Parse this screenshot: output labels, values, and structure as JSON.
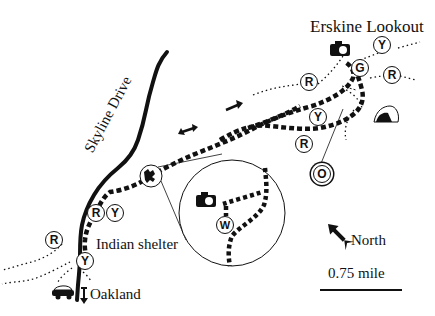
{
  "map": {
    "labels": {
      "lookout": "Erskine Lookout",
      "road": "Skyline Drive",
      "shelter": "Indian shelter",
      "town": "Oakland",
      "north": "North",
      "scale": "0.75 mile"
    },
    "markers": [
      {
        "id": "R1",
        "letter": "R",
        "x": 309,
        "y": 82
      },
      {
        "id": "Y1",
        "letter": "Y",
        "x": 318,
        "y": 117
      },
      {
        "id": "G1",
        "letter": "G",
        "x": 360,
        "y": 68
      },
      {
        "id": "Y2",
        "letter": "Y",
        "x": 382,
        "y": 45
      },
      {
        "id": "R2",
        "letter": "R",
        "x": 392,
        "y": 75
      },
      {
        "id": "R3",
        "letter": "R",
        "x": 304,
        "y": 144
      },
      {
        "id": "O1",
        "letter": "O",
        "x": 322,
        "y": 174
      },
      {
        "id": "R4",
        "letter": "R",
        "x": 96,
        "y": 213
      },
      {
        "id": "Y3",
        "letter": "Y",
        "x": 115,
        "y": 213
      },
      {
        "id": "R5",
        "letter": "R",
        "x": 54,
        "y": 240
      },
      {
        "id": "Y4",
        "letter": "Y",
        "x": 85,
        "y": 261
      },
      {
        "id": "W1",
        "letter": "W",
        "x": 225,
        "y": 225
      }
    ],
    "icons": [
      "camera-icon",
      "tent-icon",
      "car-icon",
      "trailhead-icon",
      "north-arrow-icon",
      "one-way-arrow-icon",
      "two-way-arrow-icon"
    ],
    "colors": {
      "ink": "#111111",
      "background": "#ffffff"
    }
  }
}
